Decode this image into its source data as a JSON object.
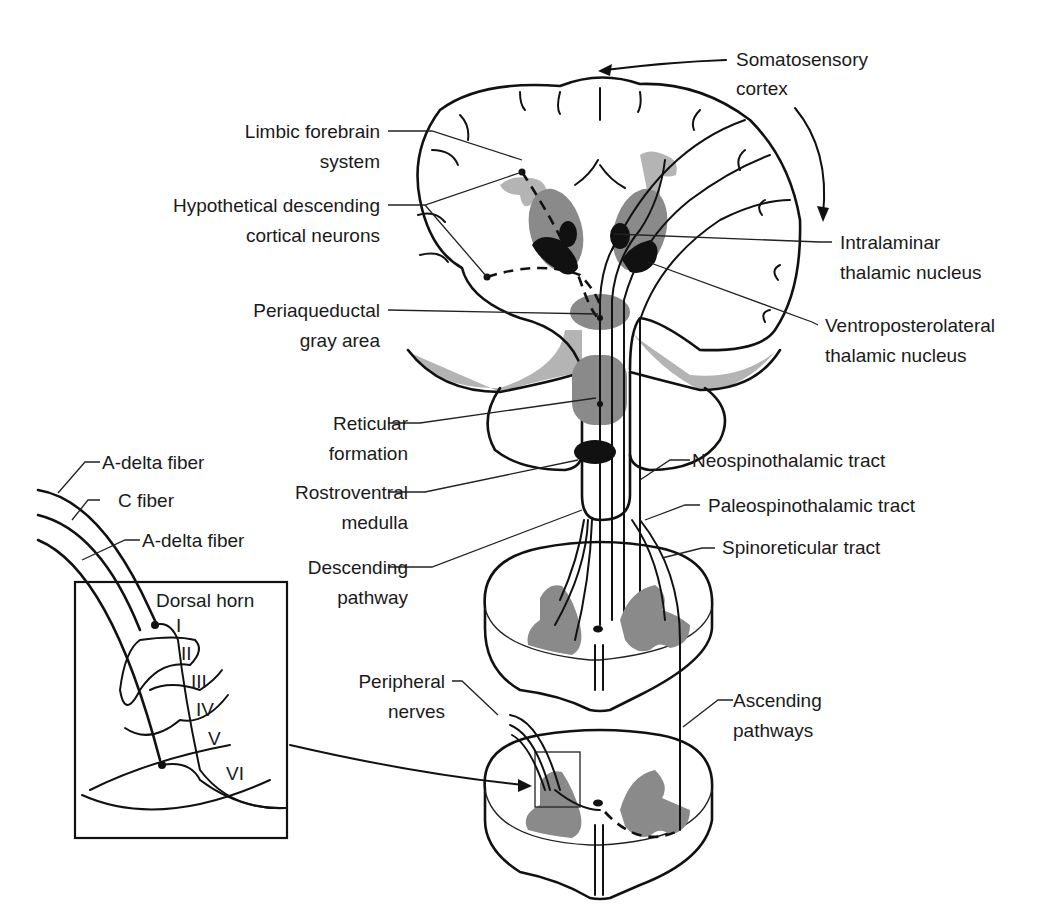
{
  "figure": {
    "colors": {
      "line": "#111111",
      "gray_matter": "#8a8a8a",
      "limbic": "#b4b4b4",
      "nucleus": "#111111",
      "background": "#ffffff"
    }
  },
  "labels": {
    "somatosensory_cortex": [
      "Somatosensory",
      "cortex"
    ],
    "limbic_forebrain": [
      "Limbic forebrain",
      "system"
    ],
    "hypothetical_descending": [
      "Hypothetical descending",
      "cortical neurons"
    ],
    "intralaminar": [
      "Intralaminar",
      "thalamic nucleus"
    ],
    "ventroposterolateral": [
      "Ventroposterolateral",
      "thalamic nucleus"
    ],
    "periaqueductal": [
      "Periaqueductal",
      "gray area"
    ],
    "reticular_formation": [
      "Reticular",
      "formation"
    ],
    "rostroventral_medulla": [
      "Rostroventral",
      "medulla"
    ],
    "neospinothalamic": "Neospinothalamic tract",
    "paleospinothalamic": "Paleospinothalamic tract",
    "spinoreticular": "Spinoreticular tract",
    "descending_pathway": [
      "Descending",
      "pathway"
    ],
    "peripheral_nerves": [
      "Peripheral",
      "nerves"
    ],
    "ascending_pathways": [
      "Ascending",
      "pathways"
    ]
  },
  "inset": {
    "title": "Dorsal horn",
    "fibers": [
      "A-delta fiber",
      "C fiber",
      "A-delta fiber"
    ],
    "laminae": [
      "I",
      "II",
      "III",
      "IV",
      "V",
      "VI"
    ]
  }
}
